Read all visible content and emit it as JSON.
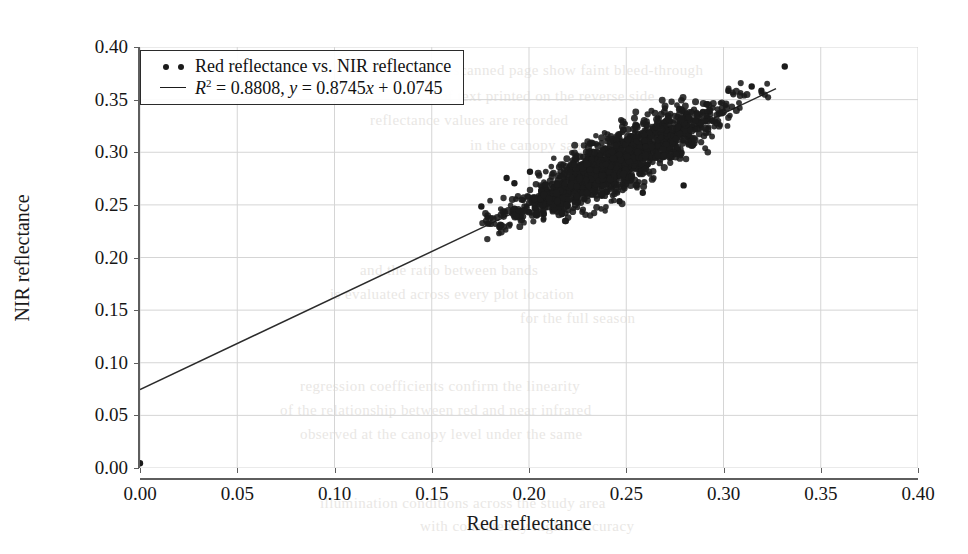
{
  "chart_data": {
    "type": "scatter",
    "title": "",
    "xlabel": "Red reflectance",
    "ylabel": "NIR reflectance",
    "xlim": [
      0.0,
      0.4
    ],
    "ylim": [
      0.0,
      0.4
    ],
    "xticks": [
      "0.00",
      "0.05",
      "0.10",
      "0.15",
      "0.20",
      "0.25",
      "0.30",
      "0.35",
      "0.40"
    ],
    "yticks": [
      "0.00",
      "0.05",
      "0.10",
      "0.15",
      "0.20",
      "0.25",
      "0.30",
      "0.35",
      "0.40"
    ],
    "xtick_values": [
      0.0,
      0.05,
      0.1,
      0.15,
      0.2,
      0.25,
      0.3,
      0.35,
      0.4
    ],
    "ytick_values": [
      0.0,
      0.05,
      0.1,
      0.15,
      0.2,
      0.25,
      0.3,
      0.35,
      0.4
    ],
    "grid": true,
    "grid_color": "#d5d5d5",
    "marker_color": "#1b1b1b",
    "line_color": "#2b2b2b",
    "background": "#ffffff",
    "legend_position": "upper left",
    "legend": [
      {
        "key": "scatter",
        "label": "Red reflectance vs. NIR reflectance",
        "marker": "dot-dot"
      },
      {
        "key": "fit",
        "label_plain": "R2 = 0.8808, y = 0.8745x + 0.0745",
        "marker": "line",
        "r_symbol": "R",
        "r_exponent": "2",
        "r_eq": " = 0.8808, ",
        "y_symbol": "y",
        "y_eq_a": " = 0.8745",
        "x_symbol": "x",
        "y_eq_b": " + 0.0745"
      }
    ],
    "fit": {
      "r_squared": 0.8808,
      "slope": 0.8745,
      "intercept": 0.0745,
      "x_start": 0.0,
      "x_end": 0.327,
      "y_start": 0.0745,
      "y_end": 0.3605
    },
    "series": [
      {
        "name": "Red reflectance vs. NIR reflectance",
        "n_points": 1600,
        "x_range": [
          0.173,
          0.332
        ],
        "y_range": [
          0.225,
          0.382
        ],
        "cluster": {
          "x_mean": 0.2425,
          "x_std": 0.0265,
          "slope": 0.8745,
          "intercept": 0.0745,
          "residual_std": 0.0092,
          "x_min": 0.176,
          "x_max": 0.331
        },
        "outliers": [
          [
            0.0,
            0.0045
          ],
          [
            0.1755,
            0.2485
          ],
          [
            0.1885,
            0.2755
          ],
          [
            0.1925,
            0.2705
          ],
          [
            0.2005,
            0.2815
          ],
          [
            0.2085,
            0.2695
          ],
          [
            0.2285,
            0.2555
          ],
          [
            0.2395,
            0.2885
          ],
          [
            0.2585,
            0.2615
          ],
          [
            0.2705,
            0.3075
          ],
          [
            0.2795,
            0.2685
          ],
          [
            0.2915,
            0.3455
          ],
          [
            0.3025,
            0.3585
          ],
          [
            0.3145,
            0.3625
          ],
          [
            0.3195,
            0.3585
          ],
          [
            0.3315,
            0.3815
          ],
          [
            0.2855,
            0.3305
          ],
          [
            0.2465,
            0.2535
          ]
        ]
      }
    ]
  },
  "page_bleed": [
    {
      "text": "the scanned page show faint bleed-through",
      "x": 430,
      "y": 62
    },
    {
      "text": "of text printed on the reverse side",
      "x": 440,
      "y": 88
    },
    {
      "text": "reflectance values are recorded",
      "x": 370,
      "y": 112
    },
    {
      "text": "in the canopy sampling grid",
      "x": 470,
      "y": 137
    },
    {
      "text": "and the ratio between bands",
      "x": 360,
      "y": 262
    },
    {
      "text": "is evaluated across every plot location",
      "x": 330,
      "y": 286
    },
    {
      "text": "for the full season",
      "x": 520,
      "y": 310
    },
    {
      "text": "regression coefficients confirm the linearity",
      "x": 300,
      "y": 378
    },
    {
      "text": "of the relationship between red and near infrared",
      "x": 280,
      "y": 402
    },
    {
      "text": "observed at the canopy level under the same",
      "x": 300,
      "y": 426
    },
    {
      "text": "illumination conditions across the study area",
      "x": 320,
      "y": 495
    },
    {
      "text": "with consistently higher accuracy",
      "x": 420,
      "y": 518
    }
  ]
}
